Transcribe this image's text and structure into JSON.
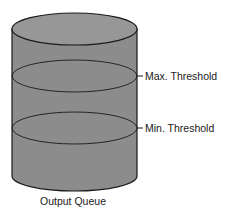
{
  "diagram": {
    "container_label": "Output Queue",
    "thresholds": [
      {
        "label": "Max. Threshold"
      },
      {
        "label": "Min. Threshold"
      }
    ],
    "colors": {
      "cylinder_fill": "#8c8c8c",
      "top_fill": "#979797",
      "stroke": "#1a1a1a"
    }
  }
}
